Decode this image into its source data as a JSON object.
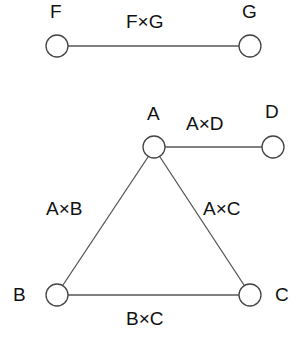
{
  "diagram": {
    "type": "graph",
    "nodes": [
      {
        "id": "F",
        "label": "F",
        "x": 57,
        "y": 46
      },
      {
        "id": "G",
        "label": "G",
        "x": 250,
        "y": 46
      },
      {
        "id": "A",
        "label": "A",
        "x": 154,
        "y": 147
      },
      {
        "id": "D",
        "label": "D",
        "x": 273,
        "y": 147
      },
      {
        "id": "B",
        "label": "B",
        "x": 57,
        "y": 295
      },
      {
        "id": "C",
        "label": "C",
        "x": 250,
        "y": 295
      }
    ],
    "edges": [
      {
        "from": "F",
        "to": "G",
        "label": "F×G"
      },
      {
        "from": "A",
        "to": "D",
        "label": "A×D"
      },
      {
        "from": "A",
        "to": "B",
        "label": "A×B"
      },
      {
        "from": "A",
        "to": "C",
        "label": "A×C"
      },
      {
        "from": "B",
        "to": "C",
        "label": "B×C"
      }
    ],
    "node_radius": 11,
    "colors": {
      "line": "#555555",
      "node_stroke": "#444444",
      "text": "#111111",
      "background": "#ffffff"
    }
  }
}
